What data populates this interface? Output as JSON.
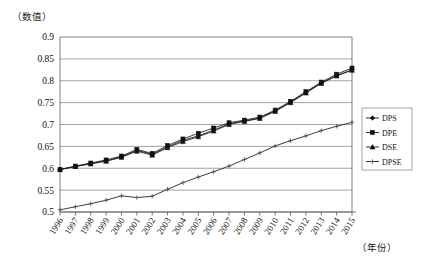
{
  "chart_data": {
    "type": "line",
    "title": "",
    "xlabel": "（年份）",
    "ylabel": "（数值）",
    "ylim": [
      0.5,
      0.9
    ],
    "ytick_step": 0.05,
    "yticks": [
      "0.5",
      "0.55",
      "0.6",
      "0.65",
      "0.7",
      "0.75",
      "0.8",
      "0.85",
      "0.9"
    ],
    "grid": true,
    "legend_position": "right",
    "categories": [
      "1996",
      "1997",
      "1998",
      "1999",
      "2000",
      "2001",
      "2002",
      "2003",
      "2004",
      "2005",
      "2006",
      "2007",
      "2008",
      "2009",
      "2010",
      "2011",
      "2012",
      "2013",
      "2014",
      "2015"
    ],
    "series": [
      {
        "name": "DPS",
        "marker": "diamond",
        "values": [
          0.597,
          0.604,
          0.611,
          0.617,
          0.626,
          0.641,
          0.632,
          0.649,
          0.664,
          0.674,
          0.687,
          0.702,
          0.708,
          0.715,
          0.731,
          0.751,
          0.773,
          0.795,
          0.812,
          0.825
        ]
      },
      {
        "name": "DPE",
        "marker": "square",
        "values": [
          0.597,
          0.605,
          0.612,
          0.619,
          0.628,
          0.643,
          0.634,
          0.652,
          0.667,
          0.68,
          0.692,
          0.704,
          0.71,
          0.717,
          0.733,
          0.753,
          0.775,
          0.797,
          0.815,
          0.829
        ]
      },
      {
        "name": "DSE",
        "marker": "triangle",
        "values": [
          0.597,
          0.604,
          0.61,
          0.616,
          0.625,
          0.639,
          0.63,
          0.647,
          0.661,
          0.672,
          0.685,
          0.7,
          0.707,
          0.714,
          0.73,
          0.75,
          0.772,
          0.794,
          0.811,
          0.824
        ]
      },
      {
        "name": "DPSE",
        "marker": "cross",
        "values": [
          0.505,
          0.512,
          0.519,
          0.527,
          0.537,
          0.533,
          0.536,
          0.552,
          0.567,
          0.58,
          0.592,
          0.605,
          0.62,
          0.635,
          0.651,
          0.663,
          0.674,
          0.686,
          0.696,
          0.705
        ]
      }
    ],
    "legend_entries": [
      "DPS",
      "DPE",
      "DSE",
      "DPSE"
    ],
    "colors": {
      "series_line": "#1a1a1a",
      "gridline": "#8c8c8c",
      "background": "#ffffff"
    }
  }
}
